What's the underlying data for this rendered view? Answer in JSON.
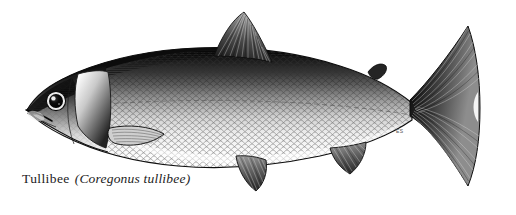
{
  "plate": {
    "background_color": "#ffffff",
    "ink_color": "#151515",
    "medium": "engraving",
    "subject_kind": "fish-illustration"
  },
  "caption": {
    "common_name": "Tullibee",
    "scientific_name": "(Coregonus tullibee)",
    "full_text": "Tullibee (Coregonus tullibee)"
  },
  "signature": {
    "initials": "ES"
  },
  "anatomy": {
    "parts": [
      {
        "name": "head",
        "label": "head"
      },
      {
        "name": "eye",
        "label": "eye"
      },
      {
        "name": "mouth",
        "label": "mouth"
      },
      {
        "name": "operculum",
        "label": "gill cover"
      },
      {
        "name": "body",
        "label": "body"
      },
      {
        "name": "scales",
        "label": "scales"
      },
      {
        "name": "lateral-line",
        "label": "lateral line"
      },
      {
        "name": "dorsal-fin",
        "label": "dorsal fin"
      },
      {
        "name": "adipose-fin",
        "label": "adipose fin"
      },
      {
        "name": "pectoral-fin",
        "label": "pectoral fin"
      },
      {
        "name": "pelvic-fin",
        "label": "pelvic fin"
      },
      {
        "name": "anal-fin",
        "label": "anal fin"
      },
      {
        "name": "caudal-fin",
        "label": "caudal fin"
      },
      {
        "name": "caudal-peduncle",
        "label": "caudal peduncle"
      }
    ]
  },
  "tones": {
    "dorsal_dark": "#141414",
    "mid_gray": "#6e6e6e",
    "belly_light": "#f2f2f2",
    "outline": "#111111",
    "fin_gray": "#4a4a4a"
  }
}
